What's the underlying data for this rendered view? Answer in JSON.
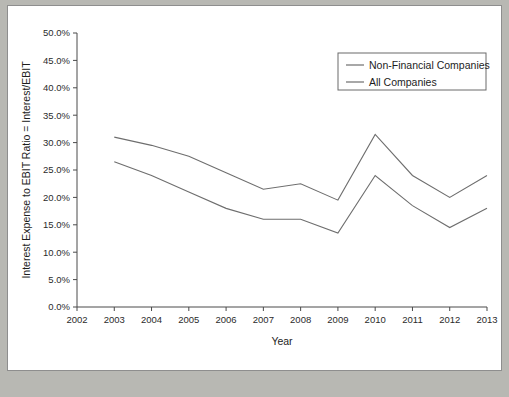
{
  "figure": {
    "background_color": "#ffffff",
    "page_background_color": "#b8b8b3",
    "border_color": "#8e8e8e"
  },
  "chart_data": {
    "type": "line",
    "title": "",
    "xlabel": "Year",
    "ylabel": "Interest Expense to EBIT Ratio = Interest/EBIT",
    "x": [
      2003,
      2004,
      2005,
      2006,
      2007,
      2008,
      2009,
      2010,
      2011,
      2012,
      2013
    ],
    "xlim": [
      2002,
      2013
    ],
    "xticks": [
      2002,
      2003,
      2004,
      2005,
      2006,
      2007,
      2008,
      2009,
      2010,
      2011,
      2012,
      2013
    ],
    "xtick_labels": [
      "2002",
      "2003",
      "2004",
      "2005",
      "2006",
      "2007",
      "2008",
      "2009",
      "2010",
      "2011",
      "2012",
      "2013"
    ],
    "ylim": [
      0,
      50
    ],
    "yticks": [
      0,
      5,
      10,
      15,
      20,
      25,
      30,
      35,
      40,
      45,
      50
    ],
    "ytick_labels": [
      "0.0%",
      "5.0%",
      "10.0%",
      "15.0%",
      "20.0%",
      "25.0%",
      "30.0%",
      "35.0%",
      "40.0%",
      "45.0%",
      "50.0%"
    ],
    "grid": false,
    "legend_position": "upper right",
    "series": [
      {
        "name": "Non-Financial Companies",
        "color": "#6e6e6e",
        "values": [
          31.0,
          29.5,
          27.5,
          24.5,
          21.5,
          22.5,
          19.5,
          31.5,
          24.0,
          20.0,
          24.0
        ]
      },
      {
        "name": "All Companies",
        "color": "#6e6e6e",
        "values": [
          26.5,
          24.0,
          21.0,
          18.0,
          16.0,
          16.0,
          13.5,
          24.0,
          18.5,
          14.5,
          18.0
        ]
      }
    ]
  },
  "legend": {
    "entries": [
      {
        "label": "Non-Financial Companies"
      },
      {
        "label": "All Companies"
      }
    ]
  }
}
